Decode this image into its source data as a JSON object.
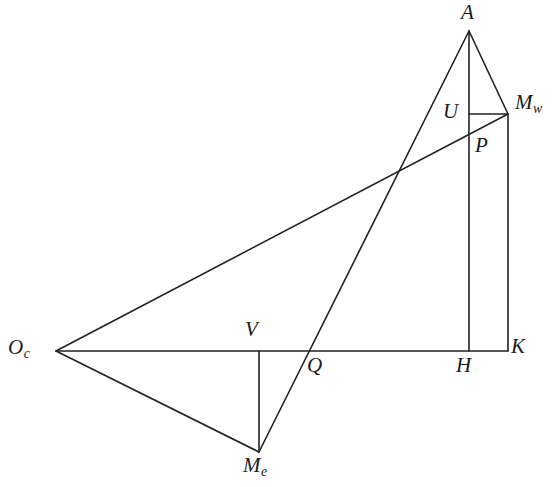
{
  "figure": {
    "type": "line-diagram",
    "width": 556,
    "height": 487,
    "background_color": "#ffffff",
    "stroke_color": "#222222",
    "stroke_width": 1.6
  },
  "points": [
    {
      "id": "A",
      "label": "A",
      "sub": "",
      "x": 469,
      "y": 31,
      "label_x": 461,
      "label_y": 2,
      "anchor": "above"
    },
    {
      "id": "Mw",
      "label": "M",
      "sub": "w",
      "x": 508,
      "y": 114,
      "label_x": 515,
      "label_y": 92,
      "anchor": "right"
    },
    {
      "id": "U",
      "label": "U",
      "sub": "",
      "x": 469,
      "y": 114,
      "label_x": 443,
      "label_y": 101,
      "anchor": "left"
    },
    {
      "id": "P",
      "label": "P",
      "sub": "",
      "x": 469,
      "y": 128,
      "label_x": 475,
      "label_y": 135,
      "anchor": "below-right"
    },
    {
      "id": "Oc",
      "label": "O",
      "sub": "c",
      "x": 56,
      "y": 351,
      "label_x": 8,
      "label_y": 337,
      "anchor": "left"
    },
    {
      "id": "V",
      "label": "V",
      "sub": "",
      "x": 259,
      "y": 351,
      "label_x": 245,
      "label_y": 319,
      "anchor": "above"
    },
    {
      "id": "Q",
      "label": "Q",
      "sub": "",
      "x": 312,
      "y": 351,
      "label_x": 307,
      "label_y": 355,
      "anchor": "below"
    },
    {
      "id": "H",
      "label": "H",
      "sub": "",
      "x": 469,
      "y": 351,
      "label_x": 456,
      "label_y": 355,
      "anchor": "below"
    },
    {
      "id": "K",
      "label": "K",
      "sub": "",
      "x": 508,
      "y": 351,
      "label_x": 511,
      "label_y": 336,
      "anchor": "right"
    },
    {
      "id": "Me",
      "label": "M",
      "sub": "e",
      "x": 259,
      "y": 452,
      "label_x": 243,
      "label_y": 455,
      "anchor": "below"
    }
  ],
  "segments": [
    {
      "id": "baseline",
      "name": "baseline-Oc-K",
      "from": "Oc",
      "to": "K",
      "x1": 56,
      "y1": 351,
      "x2": 508,
      "y2": 351
    },
    {
      "id": "ray-Oc-Mw",
      "name": "ray-Oc-to-Mw",
      "from": "Oc",
      "to": "Mw",
      "x1": 56,
      "y1": 351,
      "x2": 508,
      "y2": 114
    },
    {
      "id": "ray-Me-A",
      "name": "ray-Me-through-Q-to-A",
      "from": "Me",
      "to": "A",
      "x1": 259,
      "y1": 452,
      "x2": 469,
      "y2": 31
    },
    {
      "id": "altitude-A-H",
      "name": "vertical-A-to-H",
      "from": "A",
      "to": "H",
      "x1": 469,
      "y1": 31,
      "x2": 469,
      "y2": 351
    },
    {
      "id": "side-A-Mw",
      "name": "segment-A-to-Mw",
      "from": "A",
      "to": "Mw",
      "x1": 469,
      "y1": 31,
      "x2": 508,
      "y2": 114
    },
    {
      "id": "vert-Mw-K",
      "name": "vertical-Mw-to-K",
      "from": "Mw",
      "to": "K",
      "x1": 508,
      "y1": 114,
      "x2": 508,
      "y2": 351
    },
    {
      "id": "seg-U-Mw",
      "name": "horizontal-U-to-Mw",
      "from": "U",
      "to": "Mw",
      "x1": 469,
      "y1": 114,
      "x2": 508,
      "y2": 114
    },
    {
      "id": "vert-V-Me",
      "name": "vertical-V-to-Me",
      "from": "V",
      "to": "Me",
      "x1": 259,
      "y1": 351,
      "x2": 259,
      "y2": 452
    },
    {
      "id": "side-Oc-Me",
      "name": "segment-Oc-to-Me",
      "from": "Oc",
      "to": "Me",
      "x1": 56,
      "y1": 351,
      "x2": 259,
      "y2": 452
    }
  ]
}
